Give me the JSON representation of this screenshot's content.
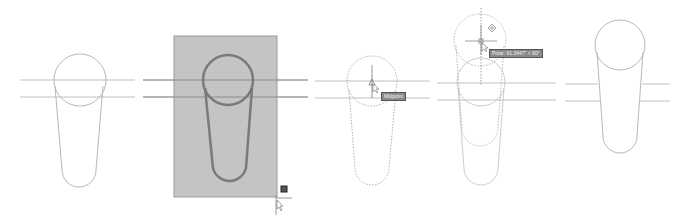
{
  "panels": [
    {
      "id": "step-1",
      "description": "Original slot shape with two horizontal construction lines"
    },
    {
      "id": "step-2",
      "description": "Crossing window selection around slot (highlighted)"
    },
    {
      "id": "step-3",
      "description": "Base point picked at circle center",
      "tooltip": "Midpoint"
    },
    {
      "id": "step-4",
      "description": "Dragging with polar tracking",
      "tooltip": "Polar: 61.3447\" < 90°"
    },
    {
      "id": "step-5",
      "description": "Stretched result"
    }
  ],
  "colors": {
    "line": "#b8b8b8",
    "selection_fill": "#c4c4c4",
    "selected_stroke": "#7a7a7a",
    "tooltip_bg": "#8a8a8a"
  }
}
